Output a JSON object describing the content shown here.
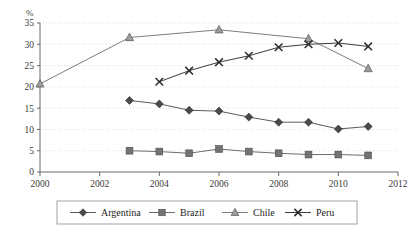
{
  "chart_data": {
    "type": "line",
    "title": "",
    "xlabel": "",
    "ylabel": "%",
    "unit_label": "%",
    "x": [
      2000,
      2001,
      2002,
      2003,
      2004,
      2005,
      2006,
      2007,
      2008,
      2009,
      2010,
      2011
    ],
    "xlim": [
      2000,
      2012
    ],
    "ylim": [
      0,
      35
    ],
    "x_ticks": [
      2000,
      2002,
      2004,
      2006,
      2008,
      2010,
      2012
    ],
    "x_tick_labels": [
      "2000",
      "2002",
      "2004",
      "2006",
      "2008",
      "2010",
      "2012"
    ],
    "y_ticks": [
      0,
      5,
      10,
      15,
      20,
      25,
      30,
      35
    ],
    "y_tick_labels": [
      "0",
      "5",
      "10",
      "15",
      "20",
      "25",
      "30",
      "35"
    ],
    "grid": true,
    "grid_axis": "y",
    "legend_position": "bottom",
    "series": [
      {
        "name": "Argentina",
        "marker": "diamond",
        "color": "#4a4a4a",
        "line_color": "#5a5a5a",
        "points": [
          {
            "x": 2003,
            "y": 16.8
          },
          {
            "x": 2004,
            "y": 16.0
          },
          {
            "x": 2005,
            "y": 14.5
          },
          {
            "x": 2006,
            "y": 14.3
          },
          {
            "x": 2007,
            "y": 12.9
          },
          {
            "x": 2008,
            "y": 11.7
          },
          {
            "x": 2009,
            "y": 11.7
          },
          {
            "x": 2010,
            "y": 10.1
          },
          {
            "x": 2011,
            "y": 10.7
          }
        ]
      },
      {
        "name": "Brazil",
        "marker": "square",
        "color": "#737373",
        "line_color": "#6e6e6e",
        "points": [
          {
            "x": 2003,
            "y": 5.0
          },
          {
            "x": 2004,
            "y": 4.8
          },
          {
            "x": 2005,
            "y": 4.4
          },
          {
            "x": 2006,
            "y": 5.4
          },
          {
            "x": 2007,
            "y": 4.8
          },
          {
            "x": 2008,
            "y": 4.4
          },
          {
            "x": 2009,
            "y": 4.1
          },
          {
            "x": 2010,
            "y": 4.1
          },
          {
            "x": 2011,
            "y": 3.9
          }
        ]
      },
      {
        "name": "Chile",
        "marker": "triangle",
        "color": "#9d9d9d",
        "line_color": "#7d7d7d",
        "points": [
          {
            "x": 2000,
            "y": 20.7
          },
          {
            "x": 2003,
            "y": 31.6
          },
          {
            "x": 2006,
            "y": 33.4
          },
          {
            "x": 2009,
            "y": 31.3
          },
          {
            "x": 2011,
            "y": 24.3
          }
        ]
      },
      {
        "name": "Peru",
        "marker": "cross",
        "color": "#2b2b2b",
        "line_color": "#3c3c3c",
        "points": [
          {
            "x": 2004,
            "y": 21.2
          },
          {
            "x": 2005,
            "y": 23.8
          },
          {
            "x": 2006,
            "y": 25.8
          },
          {
            "x": 2007,
            "y": 27.3
          },
          {
            "x": 2008,
            "y": 29.3
          },
          {
            "x": 2009,
            "y": 30.0
          },
          {
            "x": 2010,
            "y": 30.3
          },
          {
            "x": 2011,
            "y": 29.5
          }
        ]
      }
    ]
  },
  "legend": {
    "items": [
      {
        "label": "Argentina",
        "marker": "diamond"
      },
      {
        "label": "Brazil",
        "marker": "square"
      },
      {
        "label": "Chile",
        "marker": "triangle"
      },
      {
        "label": "Peru",
        "marker": "cross"
      }
    ]
  }
}
